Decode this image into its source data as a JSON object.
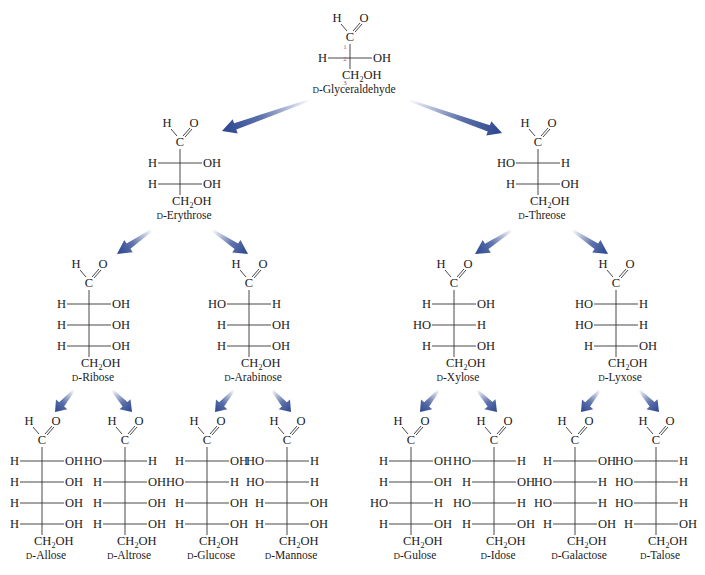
{
  "diagram": {
    "arrow_color": "#2a4590",
    "glyceraldehyde_carbon_numbers": [
      "1",
      "2",
      "3"
    ],
    "sugars": [
      {
        "id": "glyceraldehyde",
        "prefix": "D",
        "name": "-Glyceraldehyde",
        "x": 350,
        "y": 22,
        "rows": [
          [
            "H",
            "OH"
          ]
        ],
        "numbered": true
      },
      {
        "id": "erythrose",
        "prefix": "D",
        "name": "-Erythrose",
        "x": 180,
        "y": 127,
        "rows": [
          [
            "H",
            "OH"
          ],
          [
            "H",
            "OH"
          ]
        ]
      },
      {
        "id": "threose",
        "prefix": "D",
        "name": "-Threose",
        "x": 538,
        "y": 127,
        "rows": [
          [
            "HO",
            "H"
          ],
          [
            "H",
            "OH"
          ]
        ]
      },
      {
        "id": "ribose",
        "prefix": "D",
        "name": "-Ribose",
        "x": 89,
        "y": 268,
        "rows": [
          [
            "H",
            "OH"
          ],
          [
            "H",
            "OH"
          ],
          [
            "H",
            "OH"
          ]
        ]
      },
      {
        "id": "arabinose",
        "prefix": "D",
        "name": "-Arabinose",
        "x": 249,
        "y": 268,
        "rows": [
          [
            "HO",
            "H"
          ],
          [
            "H",
            "OH"
          ],
          [
            "H",
            "OH"
          ]
        ]
      },
      {
        "id": "xylose",
        "prefix": "D",
        "name": "-Xylose",
        "x": 454,
        "y": 268,
        "rows": [
          [
            "H",
            "OH"
          ],
          [
            "HO",
            "H"
          ],
          [
            "H",
            "OH"
          ]
        ]
      },
      {
        "id": "lyxose",
        "prefix": "D",
        "name": "-Lyxose",
        "x": 616,
        "y": 268,
        "rows": [
          [
            "HO",
            "H"
          ],
          [
            "HO",
            "H"
          ],
          [
            "H",
            "OH"
          ]
        ]
      },
      {
        "id": "allose",
        "prefix": "D",
        "name": "-Allose",
        "x": 42,
        "y": 425,
        "rows": [
          [
            "H",
            "OH"
          ],
          [
            "H",
            "OH"
          ],
          [
            "H",
            "OH"
          ],
          [
            "H",
            "OH"
          ]
        ]
      },
      {
        "id": "altrose",
        "prefix": "D",
        "name": "-Altrose",
        "x": 125,
        "y": 425,
        "rows": [
          [
            "HO",
            "H"
          ],
          [
            "H",
            "OH"
          ],
          [
            "H",
            "OH"
          ],
          [
            "H",
            "OH"
          ]
        ]
      },
      {
        "id": "glucose",
        "prefix": "D",
        "name": "-Glucose",
        "x": 207,
        "y": 425,
        "rows": [
          [
            "H",
            "OH"
          ],
          [
            "HO",
            "H"
          ],
          [
            "H",
            "OH"
          ],
          [
            "H",
            "OH"
          ]
        ]
      },
      {
        "id": "mannose",
        "prefix": "D",
        "name": "-Mannose",
        "x": 287,
        "y": 425,
        "rows": [
          [
            "HO",
            "H"
          ],
          [
            "HO",
            "H"
          ],
          [
            "H",
            "OH"
          ],
          [
            "H",
            "OH"
          ]
        ]
      },
      {
        "id": "gulose",
        "prefix": "D",
        "name": "-Gulose",
        "x": 411,
        "y": 425,
        "rows": [
          [
            "H",
            "OH"
          ],
          [
            "H",
            "OH"
          ],
          [
            "HO",
            "H"
          ],
          [
            "H",
            "OH"
          ]
        ]
      },
      {
        "id": "idose",
        "prefix": "D",
        "name": "-Idose",
        "x": 494,
        "y": 425,
        "rows": [
          [
            "HO",
            "H"
          ],
          [
            "H",
            "OH"
          ],
          [
            "HO",
            "H"
          ],
          [
            "H",
            "OH"
          ]
        ]
      },
      {
        "id": "galactose",
        "prefix": "D",
        "name": "-Galactose",
        "x": 575,
        "y": 425,
        "rows": [
          [
            "H",
            "OH"
          ],
          [
            "HO",
            "H"
          ],
          [
            "HO",
            "H"
          ],
          [
            "H",
            "OH"
          ]
        ]
      },
      {
        "id": "talose",
        "prefix": "D",
        "name": "-Talose",
        "x": 656,
        "y": 425,
        "rows": [
          [
            "HO",
            "H"
          ],
          [
            "HO",
            "H"
          ],
          [
            "HO",
            "H"
          ],
          [
            "H",
            "OH"
          ]
        ]
      }
    ],
    "arrows": [
      {
        "from": "glyceraldehyde",
        "to": "erythrose",
        "x1": 310,
        "y1": 100,
        "x2": 222,
        "y2": 131
      },
      {
        "from": "glyceraldehyde",
        "to": "threose",
        "x1": 408,
        "y1": 100,
        "x2": 502,
        "y2": 133
      },
      {
        "from": "erythrose",
        "to": "ribose",
        "x1": 152,
        "y1": 230,
        "x2": 117,
        "y2": 254
      },
      {
        "from": "erythrose",
        "to": "arabinose",
        "x1": 212,
        "y1": 230,
        "x2": 248,
        "y2": 254
      },
      {
        "from": "threose",
        "to": "xylose",
        "x1": 512,
        "y1": 230,
        "x2": 475,
        "y2": 254
      },
      {
        "from": "threose",
        "to": "lyxose",
        "x1": 572,
        "y1": 230,
        "x2": 608,
        "y2": 254
      },
      {
        "from": "ribose",
        "to": "allose",
        "x1": 74,
        "y1": 390,
        "x2": 55,
        "y2": 412
      },
      {
        "from": "ribose",
        "to": "altrose",
        "x1": 112,
        "y1": 390,
        "x2": 132,
        "y2": 412
      },
      {
        "from": "arabinose",
        "to": "glucose",
        "x1": 234,
        "y1": 390,
        "x2": 215,
        "y2": 412
      },
      {
        "from": "arabinose",
        "to": "mannose",
        "x1": 272,
        "y1": 390,
        "x2": 291,
        "y2": 412
      },
      {
        "from": "xylose",
        "to": "gulose",
        "x1": 439,
        "y1": 390,
        "x2": 420,
        "y2": 412
      },
      {
        "from": "xylose",
        "to": "idose",
        "x1": 477,
        "y1": 390,
        "x2": 497,
        "y2": 412
      },
      {
        "from": "lyxose",
        "to": "galactose",
        "x1": 600,
        "y1": 390,
        "x2": 581,
        "y2": 412
      },
      {
        "from": "lyxose",
        "to": "talose",
        "x1": 639,
        "y1": 390,
        "x2": 659,
        "y2": 412
      }
    ],
    "labels": {
      "aldehyde_h": "H",
      "aldehyde_o": "O",
      "carbon": "C",
      "terminal_group": "CH2OH",
      "terminal_ch": "CH",
      "terminal_sub": "2",
      "terminal_oh": "OH"
    }
  }
}
